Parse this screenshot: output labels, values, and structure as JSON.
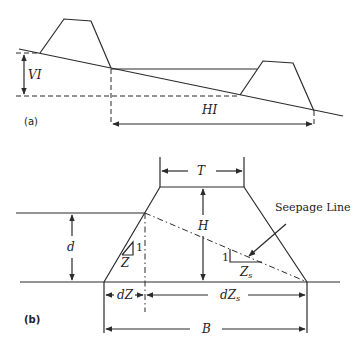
{
  "figure": {
    "panel_a": {
      "label": "(a)",
      "vertical_interval_label": "VI",
      "horizontal_interval_label": "HI"
    },
    "panel_b": {
      "label": "(b)",
      "crest_width_label": "T",
      "height_label": "H",
      "water_depth_label": "d",
      "upstream_slope_rise": "1",
      "upstream_slope_run": "Z",
      "seepage_slope_rise": "1",
      "seepage_slope_run": "Zs",
      "upstream_offset_label": "dZ",
      "seepage_offset_label": "dZs",
      "base_width_label": "B",
      "seepage_line_label": "Seepage Line"
    }
  }
}
